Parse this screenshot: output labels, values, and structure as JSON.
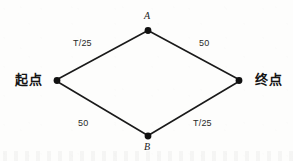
{
  "figure": {
    "type": "network-diagram",
    "background_color": "#fdfdfc",
    "line_color": "#1a1a1a",
    "node_color": "#111111"
  },
  "nodes": [
    {
      "id": "start",
      "label": "起点",
      "x": 57,
      "y": 80,
      "label_position": "left"
    },
    {
      "id": "A",
      "label": "A",
      "x": 148,
      "y": 30,
      "label_position": "above"
    },
    {
      "id": "B",
      "label": "B",
      "x": 148,
      "y": 136,
      "label_position": "below"
    },
    {
      "id": "end",
      "label": "终点",
      "x": 239,
      "y": 80,
      "label_position": "right"
    }
  ],
  "edges": [
    {
      "id": "start-A",
      "from": "start",
      "to": "A",
      "label": "T/25",
      "label_x": 73,
      "label_y": 39
    },
    {
      "id": "A-end",
      "from": "A",
      "to": "end",
      "label": "50",
      "label_x": 199,
      "label_y": 39
    },
    {
      "id": "start-B",
      "from": "start",
      "to": "B",
      "label": "50",
      "label_x": 78,
      "label_y": 119
    },
    {
      "id": "B-end",
      "from": "B",
      "to": "end",
      "label": "T/25",
      "label_x": 193,
      "label_y": 119
    }
  ]
}
